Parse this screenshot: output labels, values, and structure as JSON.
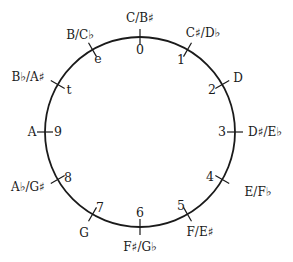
{
  "diagram": {
    "center": [
      140,
      132
    ],
    "radius": 95,
    "stroke_color": "#1a1a1a",
    "positions": [
      {
        "number": "0",
        "note": "C/B♯",
        "angle": 0,
        "num_pos": [
          140,
          50
        ],
        "note_pos": [
          140,
          18
        ]
      },
      {
        "number": "1",
        "note": "C♯/D♭",
        "angle": 30,
        "num_pos": [
          181,
          60
        ],
        "note_pos": [
          203,
          33
        ]
      },
      {
        "number": "2",
        "note": "D",
        "angle": 60,
        "num_pos": [
          212,
          90
        ],
        "note_pos": [
          238,
          78
        ]
      },
      {
        "number": "3",
        "note": "D♯/E♭",
        "angle": 90,
        "num_pos": [
          222,
          132
        ],
        "note_pos": [
          265,
          132
        ]
      },
      {
        "number": "4",
        "note": "E/F♭",
        "angle": 120,
        "num_pos": [
          210,
          177
        ],
        "note_pos": [
          258,
          192
        ]
      },
      {
        "number": "5",
        "note": "F/E♯",
        "angle": 150,
        "num_pos": [
          181,
          206
        ],
        "note_pos": [
          200,
          232
        ]
      },
      {
        "number": "6",
        "note": "F♯/G♭",
        "angle": 180,
        "num_pos": [
          140,
          213
        ],
        "note_pos": [
          140,
          247
        ]
      },
      {
        "number": "7",
        "note": "G",
        "angle": 210,
        "num_pos": [
          100,
          208
        ],
        "note_pos": [
          84,
          233
        ]
      },
      {
        "number": "8",
        "note": "A♭/G♯",
        "angle": 240,
        "num_pos": [
          68,
          178
        ],
        "note_pos": [
          28,
          187
        ]
      },
      {
        "number": "9",
        "note": "A",
        "angle": 270,
        "num_pos": [
          58,
          132
        ],
        "note_pos": [
          32,
          132
        ]
      },
      {
        "number": "t",
        "note": "B♭/A♯",
        "angle": 300,
        "num_pos": [
          69,
          90
        ],
        "note_pos": [
          28,
          77
        ]
      },
      {
        "number": "e",
        "note": "B/C♭",
        "angle": 330,
        "num_pos": [
          98,
          59
        ],
        "note_pos": [
          80,
          35
        ]
      }
    ]
  }
}
